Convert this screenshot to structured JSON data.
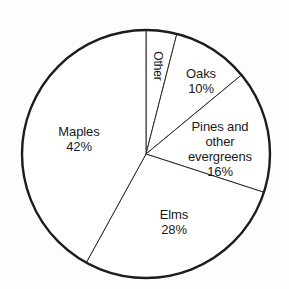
{
  "chart_data": {
    "type": "pie",
    "title": "",
    "subtitle": "",
    "xlabel": "",
    "ylabel": "",
    "legend_position": "none",
    "grid": false,
    "units": "percent",
    "total": 100,
    "start_angle_deg": 0,
    "direction": "clockwise",
    "categories": [
      "Other",
      "Oaks",
      "Pines and other evergreens",
      "Elms",
      "Maples"
    ],
    "values": [
      4,
      10,
      16,
      28,
      42
    ],
    "slices": [
      {
        "name": "Other",
        "label": "Other",
        "value": 4,
        "percent_text": "",
        "start_deg": 0,
        "end_deg": 14.4,
        "rotated": true,
        "label_x": 157,
        "label_y": 66,
        "color": "#ffffff"
      },
      {
        "name": "Oaks",
        "label": "Oaks",
        "value": 10,
        "percent_text": "10%",
        "start_deg": 14.4,
        "end_deg": 50.4,
        "rotated": false,
        "label_x": 201,
        "label_y": 81,
        "color": "#ffffff"
      },
      {
        "name": "Pines and other evergreens",
        "label": "Pines and other\nevergreens",
        "value": 16,
        "percent_text": "16%",
        "start_deg": 50.4,
        "end_deg": 108.0,
        "rotated": false,
        "label_x": 220,
        "label_y": 149,
        "color": "#ffffff"
      },
      {
        "name": "Elms",
        "label": "Elms",
        "value": 28,
        "percent_text": "28%",
        "start_deg": 108.0,
        "end_deg": 208.8,
        "rotated": false,
        "label_x": 174,
        "label_y": 222,
        "color": "#ffffff"
      },
      {
        "name": "Maples",
        "label": "Maples",
        "value": 42,
        "percent_text": "42%",
        "start_deg": 208.8,
        "end_deg": 360.0,
        "rotated": false,
        "label_x": 79,
        "label_y": 139,
        "color": "#ffffff"
      }
    ],
    "geometry": {
      "center_x": 146,
      "center_y": 154,
      "radius": 124
    },
    "colors": {
      "background": "#fdfdfd",
      "outline": "#1d1d1d",
      "divider": "#2b2b2b",
      "text": "#1a1a1a"
    }
  }
}
